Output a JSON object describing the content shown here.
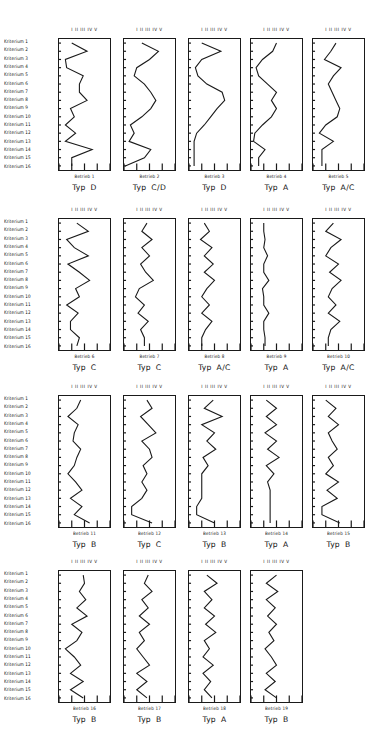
{
  "figure": {
    "row_label_prefix": "Kriterium",
    "scale_header": "I  II  III  IV  V",
    "scale_ticks": [
      "I",
      "II",
      "III",
      "IV",
      "V"
    ],
    "unit_label": "Betrieb",
    "type_label": "Typ",
    "n_criteria": 16,
    "n_units": 19,
    "line_color": "#1a1a1a",
    "frame_color": "#1a1a1a",
    "background": "#ffffff"
  },
  "row_labels": [
    "Kriterium  1",
    "Kriterium  2",
    "Kriterium  3",
    "Kriterium  4",
    "Kriterium  5",
    "Kriterium  6",
    "Kriterium  7",
    "Kriterium  8",
    "Kriterium  9",
    "Kriterium 10",
    "Kriterium 11",
    "Kriterium 12",
    "Kriterium 13",
    "Kriterium 14",
    "Kriterium 15",
    "Kriterium 16"
  ],
  "chart_data": {
    "type": "line",
    "title": "",
    "xlabel": "",
    "ylabel": "Kriterium",
    "orientation": "vertical-categories",
    "x": [
      "I",
      "II",
      "III",
      "IV",
      "V"
    ],
    "xlim": [
      1,
      5
    ],
    "categories": [
      "Kriterium 1",
      "Kriterium 2",
      "Kriterium 3",
      "Kriterium 4",
      "Kriterium 5",
      "Kriterium 6",
      "Kriterium 7",
      "Kriterium 8",
      "Kriterium 9",
      "Kriterium 10",
      "Kriterium 11",
      "Kriterium 12",
      "Kriterium 13",
      "Kriterium 14",
      "Kriterium 15",
      "Kriterium 16"
    ],
    "grid": false,
    "legend": "none",
    "panels": [
      {
        "caption": "Betrieb 1",
        "typ": "D",
        "values": [
          2.0,
          3.2,
          1.5,
          1.6,
          2.9,
          2.6,
          2.6,
          3.2,
          1.9,
          2.2,
          1.5,
          2.3,
          1.5,
          3.6,
          2.0,
          2.0
        ]
      },
      {
        "caption": "Betrieb 2",
        "typ": "C/D",
        "values": [
          2.4,
          3.7,
          3.0,
          2.0,
          1.8,
          2.6,
          3.1,
          3.5,
          3.1,
          2.4,
          1.5,
          1.8,
          1.4,
          3.1,
          2.6,
          1.1
        ]
      },
      {
        "caption": "Betrieb 3",
        "typ": "D",
        "values": [
          2.0,
          3.5,
          2.0,
          1.5,
          1.7,
          2.4,
          3.6,
          3.8,
          3.2,
          2.7,
          2.2,
          1.6,
          1.4,
          1.4,
          1.4,
          1.4
        ]
      },
      {
        "caption": "Betrieb 4",
        "typ": "A",
        "values": [
          3.0,
          2.7,
          1.9,
          1.4,
          1.6,
          2.3,
          3.0,
          2.6,
          3.0,
          2.6,
          1.9,
          1.3,
          1.2,
          2.1,
          1.6,
          1.6
        ]
      },
      {
        "caption": "Betrieb 5",
        "typ": "A/C",
        "values": [
          2.8,
          2.4,
          1.9,
          3.2,
          2.6,
          2.2,
          2.5,
          2.8,
          3.1,
          2.9,
          2.0,
          1.5,
          2.6,
          1.7,
          1.7,
          1.7
        ]
      },
      {
        "caption": "Betrieb 6",
        "typ": "C",
        "values": [
          2.4,
          3.3,
          1.6,
          2.2,
          3.3,
          1.7,
          2.6,
          3.4,
          2.3,
          2.6,
          1.6,
          2.5,
          1.9,
          1.9,
          2.6,
          2.4
        ]
      },
      {
        "caption": "Betrieb 7",
        "typ": "C",
        "values": [
          2.8,
          2.4,
          3.2,
          2.4,
          3.0,
          2.3,
          2.7,
          3.3,
          2.2,
          1.9,
          2.6,
          2.1,
          2.9,
          2.3,
          2.6,
          2.6
        ]
      },
      {
        "caption": "Betrieb 8",
        "typ": "A/C",
        "values": [
          2.2,
          2.6,
          1.9,
          2.8,
          2.2,
          2.9,
          2.2,
          3.0,
          2.4,
          2.0,
          2.6,
          2.0,
          2.8,
          2.3,
          2.0,
          2.0
        ]
      },
      {
        "caption": "Betrieb 9",
        "typ": "A",
        "values": [
          2.0,
          2.0,
          2.1,
          2.0,
          2.3,
          2.0,
          2.0,
          2.4,
          1.9,
          2.0,
          2.0,
          2.4,
          2.0,
          2.0,
          2.1,
          2.1
        ]
      },
      {
        "caption": "Betrieb 10",
        "typ": "A/C",
        "values": [
          2.6,
          2.0,
          3.2,
          2.4,
          2.0,
          3.0,
          2.3,
          3.2,
          2.5,
          2.2,
          2.8,
          2.2,
          3.1,
          2.4,
          2.2,
          2.2
        ]
      },
      {
        "caption": "Betrieb 11",
        "typ": "B",
        "values": [
          2.7,
          2.4,
          1.7,
          2.5,
          2.2,
          2.1,
          2.7,
          2.4,
          2.2,
          1.7,
          2.3,
          2.8,
          1.9,
          2.8,
          2.2,
          3.4
        ]
      },
      {
        "caption": "Betrieb 12",
        "typ": "C",
        "values": [
          2.8,
          3.2,
          2.3,
          2.9,
          3.5,
          2.4,
          3.0,
          3.2,
          2.5,
          2.8,
          2.4,
          2.8,
          2.4,
          1.6,
          1.6,
          3.2
        ]
      },
      {
        "caption": "Betrieb 13",
        "typ": "B",
        "values": [
          2.9,
          2.2,
          3.6,
          2.0,
          3.0,
          2.4,
          3.1,
          2.1,
          2.5,
          2.0,
          2.0,
          2.0,
          2.0,
          1.6,
          1.6,
          3.0
        ]
      },
      {
        "caption": "Betrieb 14",
        "typ": "A",
        "values": [
          2.2,
          3.0,
          2.2,
          3.0,
          2.1,
          3.0,
          2.3,
          3.2,
          2.2,
          2.8,
          2.3,
          2.5,
          2.5,
          2.5,
          2.5,
          2.5
        ]
      },
      {
        "caption": "Betrieb 15",
        "typ": "B",
        "values": [
          2.0,
          2.8,
          2.2,
          3.0,
          2.2,
          2.5,
          2.9,
          2.2,
          2.6,
          2.0,
          3.0,
          2.1,
          2.9,
          1.7,
          1.7,
          3.1
        ]
      },
      {
        "caption": "Betrieb 16",
        "typ": "B",
        "values": [
          2.9,
          3.0,
          2.6,
          3.1,
          2.4,
          3.2,
          2.0,
          2.8,
          2.4,
          1.5,
          2.2,
          2.7,
          1.9,
          2.9,
          1.9,
          2.9
        ]
      },
      {
        "caption": "Betrieb 17",
        "typ": "B",
        "values": [
          2.9,
          2.6,
          3.2,
          2.4,
          2.9,
          2.2,
          3.0,
          2.2,
          2.6,
          2.0,
          2.5,
          3.0,
          2.0,
          2.8,
          2.0,
          2.8
        ]
      },
      {
        "caption": "Betrieb 18",
        "typ": "A",
        "values": [
          2.4,
          3.2,
          2.2,
          2.8,
          2.2,
          3.0,
          2.3,
          3.1,
          2.2,
          2.6,
          2.1,
          2.9,
          2.1,
          2.7,
          2.2,
          2.8
        ]
      },
      {
        "caption": "Betrieb 19",
        "typ": "B",
        "values": [
          3.0,
          2.2,
          3.1,
          2.2,
          2.9,
          2.3,
          3.0,
          2.4,
          2.8,
          2.1,
          2.6,
          3.0,
          2.2,
          2.9,
          2.1,
          3.0
        ]
      }
    ]
  },
  "bands": [
    {
      "top": 28,
      "rows": 16
    },
    {
      "top": 208,
      "rows": 16
    },
    {
      "top": 385,
      "rows": 16
    },
    {
      "top": 560,
      "rows": 16
    }
  ]
}
